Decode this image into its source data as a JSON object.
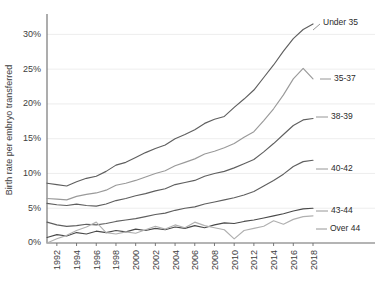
{
  "chart_data": {
    "type": "line",
    "title": "",
    "xlabel": "",
    "ylabel": "Birth rate per embryo transferred",
    "xlim": [
      1991,
      2018
    ],
    "ylim": [
      0,
      32.5
    ],
    "grid": true,
    "legend_position": "right-inline-labels",
    "ytick_labels": [
      "0%",
      "5%",
      "10%",
      "15%",
      "20%",
      "25%",
      "30%"
    ],
    "ytick_values": [
      0,
      5,
      10,
      15,
      20,
      25,
      30
    ],
    "xtick_labels": [
      "1992",
      "1994",
      "1996",
      "1998",
      "2000",
      "2002",
      "2004",
      "2006",
      "2008",
      "2010",
      "2012",
      "2014",
      "2016",
      "2018"
    ],
    "xtick_values": [
      1992,
      1994,
      1996,
      1998,
      2000,
      2002,
      2004,
      2006,
      2008,
      2010,
      2012,
      2014,
      2016,
      2018
    ],
    "x": [
      1991,
      1992,
      1993,
      1994,
      1995,
      1996,
      1997,
      1998,
      1999,
      2000,
      2001,
      2002,
      2003,
      2004,
      2005,
      2006,
      2007,
      2008,
      2009,
      2010,
      2011,
      2012,
      2013,
      2014,
      2015,
      2016,
      2017,
      2018
    ],
    "series": [
      {
        "name": "Under 35",
        "color": "#5f5f5f",
        "values": [
          8.6,
          8.4,
          8.2,
          8.8,
          9.3,
          9.6,
          10.3,
          11.2,
          11.6,
          12.3,
          13.0,
          13.6,
          14.1,
          15.0,
          15.6,
          16.3,
          17.2,
          17.8,
          18.2,
          19.5,
          20.7,
          22.0,
          23.8,
          25.6,
          27.6,
          29.4,
          30.7,
          31.5
        ]
      },
      {
        "name": "35-37",
        "color": "#9a9a9a",
        "values": [
          6.4,
          6.3,
          6.2,
          6.7,
          7.0,
          7.2,
          7.6,
          8.3,
          8.6,
          9.0,
          9.5,
          10.0,
          10.4,
          11.1,
          11.6,
          12.1,
          12.8,
          13.2,
          13.7,
          14.3,
          15.2,
          16.0,
          17.6,
          19.3,
          21.3,
          23.6,
          25.1,
          23.6
        ]
      },
      {
        "name": "38-39",
        "color": "#5f5f5f",
        "values": [
          5.7,
          5.5,
          5.4,
          5.6,
          5.4,
          5.3,
          5.6,
          6.1,
          6.4,
          6.8,
          7.1,
          7.5,
          7.8,
          8.4,
          8.7,
          9.0,
          9.6,
          10.0,
          10.3,
          10.8,
          11.4,
          12.0,
          13.1,
          14.3,
          15.6,
          16.9,
          17.7,
          17.9
        ]
      },
      {
        "name": "40-42",
        "color": "#5f5f5f",
        "values": [
          3.0,
          2.6,
          2.4,
          2.5,
          2.7,
          2.6,
          2.8,
          3.1,
          3.3,
          3.5,
          3.8,
          4.1,
          4.3,
          4.7,
          5.0,
          5.2,
          5.6,
          5.9,
          6.2,
          6.5,
          6.9,
          7.4,
          8.2,
          9.0,
          9.9,
          11.0,
          11.7,
          11.9
        ]
      },
      {
        "name": "43-44",
        "color": "#4a4a4a",
        "values": [
          0.8,
          1.2,
          1.0,
          1.5,
          1.3,
          1.7,
          1.5,
          1.8,
          1.6,
          2.0,
          1.8,
          2.1,
          1.9,
          2.3,
          2.1,
          2.5,
          2.2,
          2.6,
          2.9,
          2.8,
          3.1,
          3.3,
          3.6,
          3.9,
          4.2,
          4.6,
          4.9,
          5.0
        ]
      },
      {
        "name": "Over 44",
        "color": "#b0b0b0",
        "values": [
          0.0,
          0.6,
          1.1,
          1.8,
          2.3,
          3.0,
          1.5,
          1.3,
          1.6,
          1.4,
          1.9,
          2.4,
          2.0,
          2.6,
          2.2,
          3.0,
          2.5,
          2.2,
          1.9,
          0.6,
          1.8,
          2.1,
          2.4,
          3.2,
          2.7,
          3.4,
          3.8,
          3.9
        ]
      }
    ],
    "series_labels": [
      {
        "name": "Under 35",
        "x": 323,
        "y": 23
      },
      {
        "name": "35-37",
        "x": 334,
        "y": 79
      },
      {
        "name": "38-39",
        "x": 331,
        "y": 117
      },
      {
        "name": "40-42",
        "x": 331,
        "y": 169
      },
      {
        "name": "43-44",
        "x": 331,
        "y": 211
      },
      {
        "name": "Over 44",
        "x": 330,
        "y": 229
      }
    ],
    "leader_lines": [
      {
        "name": "Under 35",
        "x1": 313,
        "y1": 30,
        "x2": 320,
        "y2": 24
      },
      {
        "name": "35-37",
        "x1": 320,
        "y1": 79,
        "x2": 331,
        "y2": 79
      },
      {
        "name": "38-39",
        "x1": 316,
        "y1": 117,
        "x2": 328,
        "y2": 117
      },
      {
        "name": "40-42",
        "x1": 316,
        "y1": 169,
        "x2": 328,
        "y2": 169
      },
      {
        "name": "43-44",
        "x1": 316,
        "y1": 211,
        "x2": 328,
        "y2": 211
      },
      {
        "name": "Over 44",
        "x1": 316,
        "y1": 229,
        "x2": 327,
        "y2": 229
      }
    ]
  },
  "plot": {
    "left": 47,
    "right": 313,
    "top": 17,
    "bottom": 243
  }
}
